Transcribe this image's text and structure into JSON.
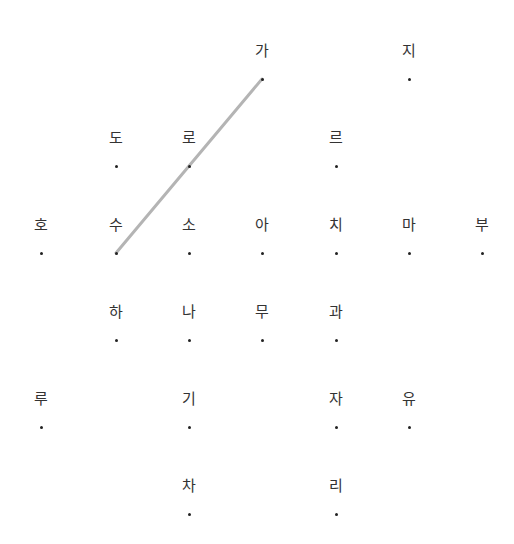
{
  "board": {
    "columns_x": [
      41,
      116,
      189,
      262,
      336,
      409,
      482
    ],
    "rows_y": [
      79,
      166,
      253,
      340,
      427,
      514
    ],
    "nodes": [
      {
        "char": "가",
        "col": 3,
        "row": 0
      },
      {
        "char": "지",
        "col": 5,
        "row": 0
      },
      {
        "char": "도",
        "col": 1,
        "row": 1
      },
      {
        "char": "로",
        "col": 2,
        "row": 1
      },
      {
        "char": "르",
        "col": 4,
        "row": 1
      },
      {
        "char": "호",
        "col": 0,
        "row": 2
      },
      {
        "char": "수",
        "col": 1,
        "row": 2
      },
      {
        "char": "소",
        "col": 2,
        "row": 2
      },
      {
        "char": "아",
        "col": 3,
        "row": 2
      },
      {
        "char": "치",
        "col": 4,
        "row": 2
      },
      {
        "char": "마",
        "col": 5,
        "row": 2
      },
      {
        "char": "부",
        "col": 6,
        "row": 2
      },
      {
        "char": "하",
        "col": 1,
        "row": 3
      },
      {
        "char": "나",
        "col": 2,
        "row": 3
      },
      {
        "char": "무",
        "col": 3,
        "row": 3
      },
      {
        "char": "과",
        "col": 4,
        "row": 3
      },
      {
        "char": "루",
        "col": 0,
        "row": 4
      },
      {
        "char": "기",
        "col": 2,
        "row": 4
      },
      {
        "char": "자",
        "col": 4,
        "row": 4
      },
      {
        "char": "유",
        "col": 5,
        "row": 4
      },
      {
        "char": "차",
        "col": 2,
        "row": 5
      },
      {
        "char": "리",
        "col": 4,
        "row": 5
      }
    ],
    "selected_path": [
      "수",
      "로",
      "가"
    ],
    "line_color": "#b4b4b4",
    "label_color": "#333333",
    "dot_color": "#222222"
  }
}
